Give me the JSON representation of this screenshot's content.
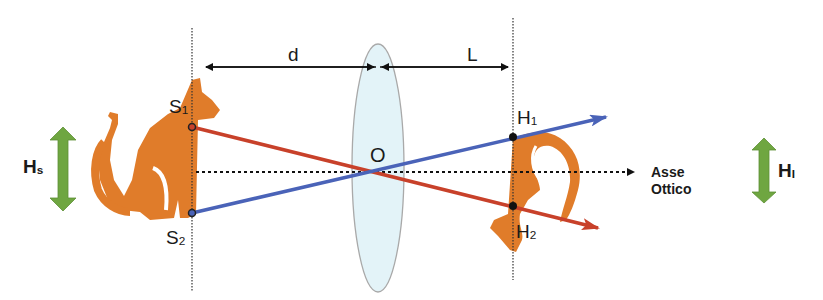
{
  "diagram": {
    "type": "thin-lens-image-formation",
    "colors": {
      "cat": "#E07C2A",
      "ray_red": "#C8412A",
      "ray_blue": "#4A63B8",
      "height_arrow": "#6FA641",
      "lens_fill": "#E3F3F8",
      "lens_stroke": "#A9A9A9",
      "line": "#111111"
    },
    "labels": {
      "distance_object": "d",
      "distance_image": "L",
      "object_top": {
        "base": "S",
        "sub": "1"
      },
      "object_bottom": {
        "base": "S",
        "sub": "2"
      },
      "image_top": {
        "base": "H",
        "sub": "1"
      },
      "image_bottom": {
        "base": "H",
        "sub": "2"
      },
      "center": "O",
      "object_height": {
        "base": "H",
        "sub": "s"
      },
      "image_height": {
        "base": "H",
        "sub": "I"
      },
      "axis_line1": "Asse",
      "axis_line2": "Ottico"
    }
  }
}
